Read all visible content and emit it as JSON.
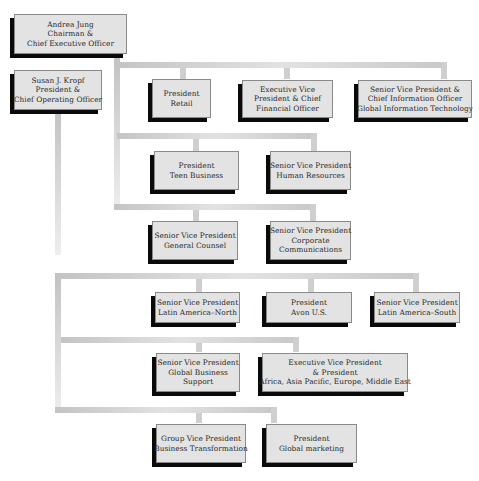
{
  "chart": {
    "nodes": [
      {
        "id": "ceo",
        "lines": [
          "Andrea Jung",
          "Chairman &",
          "Chief Executive Officer"
        ]
      },
      {
        "id": "coo",
        "lines": [
          "Susan J. Kropf",
          "President &",
          "Chief Operating Officer"
        ]
      },
      {
        "id": "retail",
        "lines": [
          "President",
          "Retail"
        ]
      },
      {
        "id": "cfo",
        "lines": [
          "Executive Vice",
          "President & Chief",
          "Financial Officer"
        ]
      },
      {
        "id": "cio",
        "lines": [
          "Senior Vice President &",
          "Chief Information Officer",
          "Global Information Technology"
        ]
      },
      {
        "id": "teen",
        "lines": [
          "President",
          "Teen Business"
        ]
      },
      {
        "id": "hr",
        "lines": [
          "Senior Vice President",
          "Human Resources"
        ]
      },
      {
        "id": "gc",
        "lines": [
          "Senior Vice President",
          "General Counsel"
        ]
      },
      {
        "id": "corpcomm",
        "lines": [
          "Senior Vice President",
          "Corporate",
          "Communications"
        ]
      },
      {
        "id": "lanorth",
        "lines": [
          "Senior Vice President",
          "Latin America–North"
        ]
      },
      {
        "id": "avonus",
        "lines": [
          "President",
          "Avon U.S."
        ]
      },
      {
        "id": "lasouth",
        "lines": [
          "Senior Vice President",
          "Latin America–South"
        ]
      },
      {
        "id": "gbs",
        "lines": [
          "Senior Vice President",
          "Global Business",
          "Support"
        ]
      },
      {
        "id": "evpintl",
        "lines": [
          "Executive Vice President",
          "& President",
          "Africa, Asia Pacific, Europe, Middle East"
        ]
      },
      {
        "id": "gvpbt",
        "lines": [
          "Group Vice President",
          "Business Transformation"
        ]
      },
      {
        "id": "globalmkt",
        "lines": [
          "President",
          "Global marketing"
        ]
      }
    ],
    "reports_to": {
      "ceo": [
        "coo",
        "retail",
        "cfo",
        "cio",
        "teen",
        "hr",
        "gc",
        "corpcomm"
      ],
      "coo": [
        "lanorth",
        "avonus",
        "lasouth",
        "gbs",
        "evpintl",
        "gvpbt",
        "globalmkt"
      ]
    }
  }
}
